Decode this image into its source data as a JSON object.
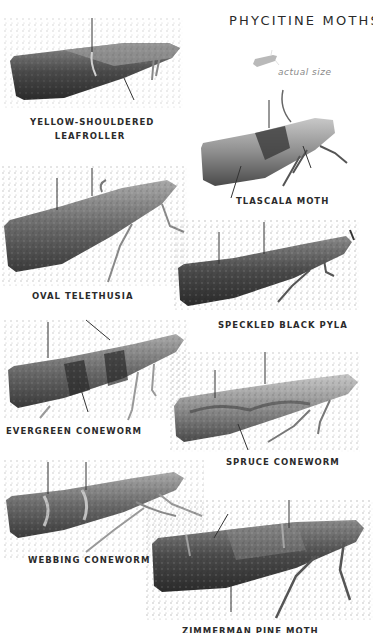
{
  "title": "PHYCITINE MOTHS",
  "scale_note": "actual size",
  "moths": [
    {
      "name": "YELLOW-SHOULDERED",
      "name2": "LEAFROLLER"
    },
    {
      "name": "TLASCALA MOTH"
    },
    {
      "name": "OVAL TELETHUSIA"
    },
    {
      "name": "SPECKLED BLACK PYLA"
    },
    {
      "name": "EVERGREEN CONEWORM"
    },
    {
      "name": "SPRUCE CONEWORM"
    },
    {
      "name": "WEBBING CONEWORM"
    },
    {
      "name": "ZIMMERMAN PINE MOTH"
    }
  ],
  "colors": {
    "background": "#ffffff",
    "text": "#2b2b2b",
    "scale_silhouette": "#b8b8b8",
    "moth_dark": "#3a3a3a",
    "moth_mid": "#6e6e6e",
    "moth_light": "#a8a8a8"
  }
}
